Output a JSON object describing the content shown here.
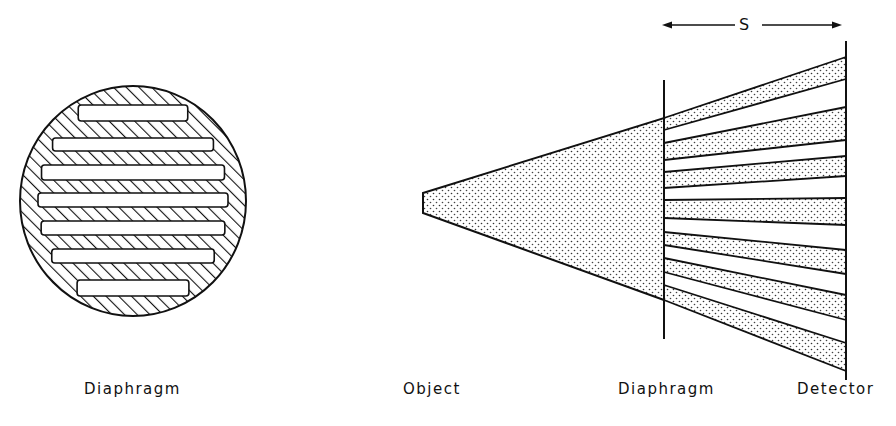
{
  "labels": {
    "left_diaphragm": "Diaphragm",
    "object": "Object",
    "right_diaphragm": "Diaphragm",
    "detector": "Detector",
    "distance": "S"
  },
  "geometry": {
    "circle": {
      "cx": 133,
      "cy": 201,
      "rx": 113,
      "ry": 115
    },
    "circle_slots_y": [
      [
        105,
        121
      ],
      [
        138,
        151
      ],
      [
        165,
        180
      ],
      [
        193,
        207
      ],
      [
        221,
        235
      ],
      [
        249,
        263
      ],
      [
        280,
        296
      ]
    ],
    "object_x": 423,
    "object_y": [
      193,
      213
    ],
    "diaphragm_x": 664,
    "diaphragm_line_y": [
      80,
      339
    ],
    "detector_x": 846,
    "detector_line_y": [
      41,
      380
    ],
    "beams_at_diaphragm": [
      [
        118,
        130
      ],
      [
        143,
        160
      ],
      [
        172,
        188
      ],
      [
        200,
        218
      ],
      [
        232,
        245
      ],
      [
        258,
        272
      ],
      [
        285,
        300
      ]
    ],
    "beams_at_detector": [
      [
        57,
        79
      ],
      [
        107,
        140
      ],
      [
        156,
        176
      ],
      [
        198,
        225
      ],
      [
        250,
        274
      ],
      [
        295,
        320
      ],
      [
        343,
        371
      ]
    ],
    "arrow": {
      "y": 25,
      "x1": 662,
      "x2": 842
    }
  },
  "colors": {
    "ink": "#111111",
    "background": "#ffffff"
  }
}
